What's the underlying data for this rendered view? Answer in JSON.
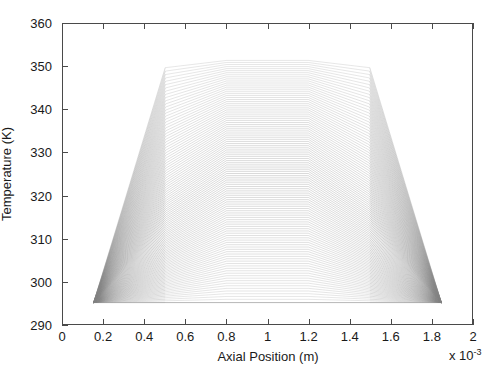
{
  "figure": {
    "type": "line-plot",
    "background": "#ffffff",
    "axis_color": "#4a4a4a",
    "line_color": "#808080"
  },
  "axes": {
    "xlabel": "Axial Position (m)",
    "ylabel": "Temperature (K)",
    "x_multiplier": "x 10",
    "x_multiplier_exponent": "-3",
    "xticks": [
      "0",
      "0.2",
      "0.4",
      "0.6",
      "0.8",
      "1",
      "1.2",
      "1.4",
      "1.6",
      "1.8",
      "2"
    ],
    "yticks": [
      "290",
      "300",
      "310",
      "320",
      "330",
      "340",
      "350",
      "360"
    ]
  },
  "chart_data": {
    "type": "line",
    "title": "",
    "xlabel": "Axial Position (m)",
    "ylabel": "Temperature (K)",
    "xlim": [
      0,
      0.002
    ],
    "ylim": [
      290,
      360
    ],
    "x_scale_factor": 0.001,
    "grid": false,
    "legend": "none",
    "n_series": 110,
    "x_breakpoints": [
      0.00015,
      0.0005,
      0.0008,
      0.0012,
      0.0015,
      0.00185
    ],
    "baseline_temperature": 295,
    "peak_temperature": 351.5,
    "envelope_upper": {
      "x": [
        0.00015,
        0.0005,
        0.0008,
        0.0012,
        0.0015,
        0.00185
      ],
      "y": [
        351.5,
        351.5,
        351.5,
        351.5,
        351.5,
        351.5
      ]
    },
    "envelope_lower": {
      "x": [
        0.00015,
        0.0005,
        0.0008,
        0.0012,
        0.0015,
        0.00185
      ],
      "y": [
        295,
        295,
        295,
        295,
        295,
        295
      ]
    },
    "series_shape": {
      "x": [
        0.00015,
        0.0005,
        0.0008,
        0.0012,
        0.0015,
        0.00185
      ],
      "note": "Each profile follows y = [T_in, T_mid1, T_plateau, T_plateau, T_mid2, T_out] where T_plateau spans 295..351.5 across the family"
    },
    "series": [
      {
        "name": "profile-001",
        "values": [
          295.0,
          295.4,
          295.7,
          295.7,
          295.4,
          295.0
        ]
      },
      {
        "name": "profile-010",
        "values": [
          295.0,
          300.6,
          303.9,
          303.9,
          300.6,
          295.0
        ]
      },
      {
        "name": "profile-020",
        "values": [
          295.0,
          307.1,
          312.6,
          312.6,
          307.1,
          295.0
        ]
      },
      {
        "name": "profile-030",
        "values": [
          295.0,
          313.5,
          321.2,
          321.2,
          313.5,
          295.0
        ]
      },
      {
        "name": "profile-040",
        "values": [
          295.0,
          319.9,
          329.8,
          329.8,
          319.9,
          295.0
        ]
      },
      {
        "name": "profile-050",
        "values": [
          295.0,
          326.3,
          338.5,
          338.5,
          326.3,
          295.0
        ]
      },
      {
        "name": "profile-060",
        "values": [
          295.0,
          332.8,
          345.0,
          345.0,
          332.8,
          295.0
        ]
      },
      {
        "name": "profile-070",
        "values": [
          295.0,
          338.2,
          348.6,
          348.6,
          338.2,
          295.0
        ]
      },
      {
        "name": "profile-080",
        "values": [
          295.0,
          343.0,
          350.4,
          350.4,
          343.0,
          295.0
        ]
      },
      {
        "name": "profile-090",
        "values": [
          295.0,
          346.9,
          351.1,
          351.1,
          346.9,
          295.0
        ]
      },
      {
        "name": "profile-100",
        "values": [
          295.0,
          349.6,
          351.4,
          351.4,
          349.6,
          295.0
        ]
      },
      {
        "name": "profile-110",
        "values": [
          295.0,
          351.0,
          351.5,
          351.5,
          351.0,
          295.0
        ]
      }
    ]
  }
}
